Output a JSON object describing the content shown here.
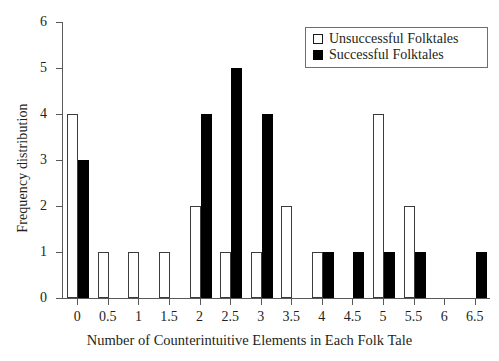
{
  "chart_data": {
    "type": "bar",
    "title": "",
    "xlabel": "Number of Counterintuitive Elements in Each Folk Tale",
    "ylabel": "Frequency distribution",
    "categories": [
      "0",
      "0.5",
      "1",
      "1.5",
      "2",
      "2.5",
      "3",
      "3.5",
      "4",
      "4.5",
      "5",
      "5.5",
      "6",
      "6.5"
    ],
    "xtick_labels": [
      "0",
      "0.5",
      "1",
      "1.5",
      "2",
      "2.5",
      "3",
      "3.5",
      "4",
      "4.5",
      "5",
      "5.5",
      "6",
      "6.5"
    ],
    "ytick_labels": [
      "0",
      "1",
      "2",
      "3",
      "4",
      "5",
      "6"
    ],
    "ylim": [
      0,
      6
    ],
    "xlim": [
      -0.25,
      6.75
    ],
    "grid": false,
    "legend_position": "top-right",
    "series": [
      {
        "name": "Unsuccessful Folktales",
        "style": "open",
        "color": "#ffffff",
        "edge_color": "#3b3b3b",
        "values": [
          4,
          1,
          1,
          1,
          2,
          1,
          1,
          2,
          1,
          0,
          4,
          2,
          0,
          0
        ]
      },
      {
        "name": "Successful Folktales",
        "style": "filled",
        "color": "#000000",
        "edge_color": "#000000",
        "values": [
          3,
          0,
          0,
          0,
          4,
          5,
          4,
          0,
          1,
          1,
          1,
          1,
          0,
          1
        ]
      }
    ]
  },
  "legend": {
    "items": [
      {
        "label": "Unsuccessful Folktales",
        "swatch": "open-square-icon"
      },
      {
        "label": "Successful Folktales",
        "swatch": "filled-square-icon"
      }
    ]
  },
  "axes": {
    "x_title": "Number of Counterintuitive Elements in Each Folk Tale",
    "y_title": "Frequency distribution"
  }
}
